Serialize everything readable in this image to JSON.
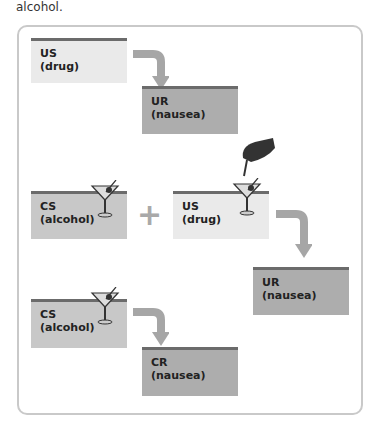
{
  "caption": "alcohol.",
  "stages": {
    "before": {
      "us": {
        "label": "US",
        "sub": "(drug)"
      },
      "ur": {
        "label": "UR",
        "sub": "(nausea)"
      }
    },
    "during": {
      "cs": {
        "label": "CS",
        "sub": "(alcohol)"
      },
      "plus": "+",
      "us": {
        "label": "US",
        "sub": "(drug)"
      },
      "ur": {
        "label": "UR",
        "sub": "(nausea)"
      }
    },
    "after": {
      "cs": {
        "label": "CS",
        "sub": "(alcohol)"
      },
      "cr": {
        "label": "CR",
        "sub": "(nausea)"
      }
    }
  },
  "colors": {
    "light": "#eaeaea",
    "mid": "#c8c8c8",
    "dark": "#adadad",
    "arrow": "#a6a6a6",
    "bar": "#6b6b6b"
  }
}
